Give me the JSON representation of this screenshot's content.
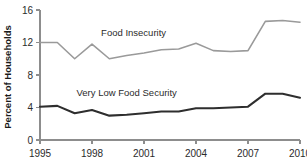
{
  "chart_data": {
    "type": "line",
    "title": "",
    "subtitle": "",
    "xlabel": "",
    "ylabel": "Percent of Households",
    "xlim": [
      1995,
      2010
    ],
    "ylim": [
      0,
      16
    ],
    "grid": false,
    "legend_position": "inline-annotation",
    "x": [
      1995,
      1996,
      1997,
      1998,
      1999,
      2000,
      2001,
      2002,
      2003,
      2004,
      2005,
      2006,
      2007,
      2008,
      2009,
      2010
    ],
    "xticks": [
      "1995",
      "1998",
      "2001",
      "2004",
      "2007",
      "2010"
    ],
    "xtick_values": [
      1995,
      1998,
      2001,
      2004,
      2007,
      2010
    ],
    "yticks": [
      "0",
      "4",
      "8",
      "12",
      "16"
    ],
    "ytick_values": [
      0,
      4,
      8,
      12,
      16
    ],
    "series": [
      {
        "name": "Food Insecurity",
        "color": "#9a9a9a",
        "width": 1.6,
        "label_x": 2000.4,
        "label_y": 12.8,
        "values": [
          12.0,
          12.0,
          10.0,
          11.8,
          10.0,
          10.4,
          10.7,
          11.1,
          11.2,
          11.9,
          11.0,
          10.9,
          11.0,
          14.6,
          14.7,
          14.5
        ]
      },
      {
        "name": "Very Low Food Security",
        "color": "#2e2e2e",
        "width": 2.1,
        "label_x": 2000.0,
        "label_y": 5.4,
        "values": [
          4.1,
          4.2,
          3.3,
          3.7,
          3.0,
          3.1,
          3.3,
          3.5,
          3.5,
          3.9,
          3.9,
          4.0,
          4.1,
          5.7,
          5.7,
          5.2
        ]
      }
    ]
  },
  "axis": {
    "y_title": "Percent of Households"
  }
}
